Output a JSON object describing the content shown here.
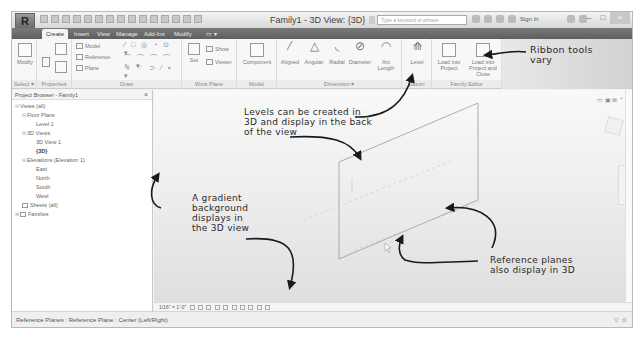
{
  "window": {
    "title": "Family1 - 3D View: {3D}",
    "app_button": "R",
    "search_placeholder": "Type a keyword or phrase",
    "sign_in": "Sign In",
    "controls": [
      "–",
      "□",
      "×"
    ]
  },
  "tabs": [
    {
      "label": "Create",
      "active": true
    },
    {
      "label": "Insert"
    },
    {
      "label": "View"
    },
    {
      "label": "Manage"
    },
    {
      "label": "Add-Ins"
    },
    {
      "label": "Modify"
    },
    {
      "label": "▭ ▾"
    }
  ],
  "ribbon": {
    "select": {
      "tool": "Modify",
      "panel": "Select ▾"
    },
    "properties": {
      "panel": "Properties"
    },
    "forms": {
      "model": "Model",
      "reference": "Reference",
      "plane": "Plane"
    },
    "draw": {
      "panel": "Draw",
      "row1": "⁄ □ ◎ ◔ ⊙ ▾",
      "row2": "⌒ ⌒ ⌒ ⌒ ∿ ▾",
      "row3": "∿ ⌔ ⊃ ⁄ ▪ ▾"
    },
    "work_plane": {
      "panel": "Work Plane",
      "set": "Set",
      "show": "Show",
      "viewer": "Viewer"
    },
    "model": {
      "panel": "Model",
      "component": "Component"
    },
    "dimension": {
      "panel": "Dimension ▾",
      "tools": [
        "Aligned",
        "Angular",
        "Radial",
        "Diameter",
        "Arc Length"
      ]
    },
    "datum": {
      "panel": "Datum",
      "level": "Level"
    },
    "family_editor": {
      "panel": "Family Editor",
      "load_project": "Load into Project",
      "load_close": "Load into Project and Close"
    }
  },
  "project_browser": {
    "title": "Project Browser - Family1",
    "close": "×",
    "tree": [
      {
        "label": "Views (all)",
        "level": 0,
        "expander": "⊟"
      },
      {
        "label": "Floor Plans",
        "level": 1,
        "expander": "⊟"
      },
      {
        "label": "Level 1",
        "level": 2
      },
      {
        "label": "3D Views",
        "level": 1,
        "expander": "⊟"
      },
      {
        "label": "3D View 1",
        "level": 2
      },
      {
        "label": "{3D}",
        "level": 2,
        "bold": true
      },
      {
        "label": "Elevations (Elevation 1)",
        "level": 1,
        "expander": "⊟"
      },
      {
        "label": "East",
        "level": 2
      },
      {
        "label": "North",
        "level": 2
      },
      {
        "label": "South",
        "level": 2
      },
      {
        "label": "West",
        "level": 2
      },
      {
        "label": "Sheets (all)",
        "level": 0
      },
      {
        "label": "Families",
        "level": 0,
        "expander": "⊞"
      }
    ]
  },
  "annotations": {
    "ribbon": [
      "Ribbon tools",
      "vary"
    ],
    "levels": [
      "Levels can be created in",
      "3D and display in the back",
      "of the view"
    ],
    "gradient": [
      "A gradient",
      "background",
      "displays in",
      "the 3D view"
    ],
    "refplanes": [
      "Reference planes",
      "also display in 3D"
    ]
  },
  "viewport": {
    "top_icons": "▭ ▣ ⊠ ⌃"
  },
  "view_control_bar": {
    "scale": "1/16\" = 1'-0\""
  },
  "status_bar": {
    "text": "Reference Planes : Reference Plane : Center (Left/Right)",
    "right": "▽ :0"
  }
}
